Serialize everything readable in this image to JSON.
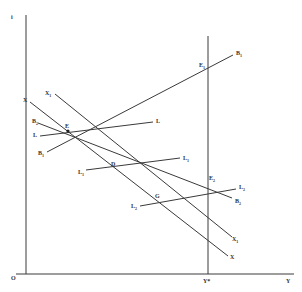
{
  "diagram": {
    "axes": {
      "y_axis_label": "i",
      "x_axis_label": "Y",
      "origin_label": "O",
      "full_employment_label": "Y*",
      "full_employment_superscript": "**"
    },
    "curves": [
      {
        "id": "B1",
        "label": "B",
        "sub": "1",
        "type": "line"
      },
      {
        "id": "B2",
        "label": "B",
        "sub": "2",
        "type": "line"
      },
      {
        "id": "L",
        "label": "L",
        "sub": "",
        "type": "line"
      },
      {
        "id": "L1",
        "label": "L",
        "sub": "1",
        "type": "line"
      },
      {
        "id": "L2",
        "label": "L",
        "sub": "2",
        "type": "line"
      },
      {
        "id": "X",
        "label": "X",
        "sub": "",
        "type": "line"
      },
      {
        "id": "X1",
        "label": "X",
        "sub": "1",
        "type": "line"
      }
    ],
    "points": [
      {
        "id": "E",
        "label": "E",
        "sub": ""
      },
      {
        "id": "E1",
        "label": "E",
        "sub": "1"
      },
      {
        "id": "E2",
        "label": "E",
        "sub": "2"
      },
      {
        "id": "D",
        "label": "D",
        "sub": ""
      },
      {
        "id": "G",
        "label": "G",
        "sub": ""
      }
    ],
    "colors": {
      "line": "#3a3a3a",
      "background": "#ffffff"
    }
  }
}
